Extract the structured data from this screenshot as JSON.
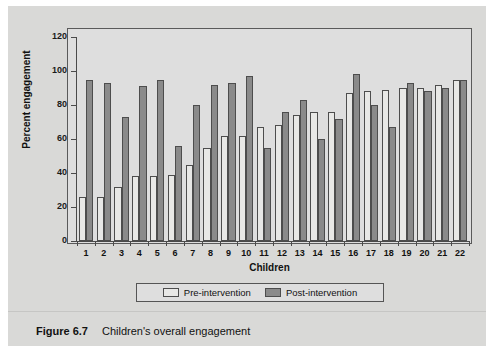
{
  "figure": {
    "caption_number": "Figure 6.7",
    "caption_text": "Children's overall engagement"
  },
  "legend": {
    "position": "bottom",
    "items": [
      {
        "label": "Pre-intervention",
        "color": "#e8e8e6"
      },
      {
        "label": "Post-intervention",
        "color": "#8a8a8a"
      }
    ]
  },
  "axes": {
    "y_title": "Percent engagement",
    "x_title": "Children",
    "y_ticks": [
      "0",
      "20",
      "40",
      "60",
      "80",
      "100",
      "120"
    ]
  },
  "chart_data": {
    "type": "bar",
    "title": "Children's overall engagement",
    "xlabel": "Children",
    "ylabel": "Percent engagement",
    "ylim": [
      0,
      120
    ],
    "ytick_step": 20,
    "grid": false,
    "legend_position": "bottom",
    "categories": [
      "1",
      "2",
      "3",
      "4",
      "5",
      "6",
      "7",
      "8",
      "9",
      "10",
      "11",
      "12",
      "13",
      "14",
      "15",
      "16",
      "17",
      "18",
      "19",
      "20",
      "21",
      "22"
    ],
    "series": [
      {
        "name": "Pre-intervention",
        "color": "#e8e8e6",
        "values": [
          26,
          26,
          32,
          38,
          38,
          39,
          45,
          55,
          62,
          62,
          67,
          68,
          74,
          76,
          76,
          87,
          88,
          89,
          90,
          90,
          92,
          95
        ]
      },
      {
        "name": "Post-intervention",
        "color": "#8a8a8a",
        "values": [
          95,
          93,
          73,
          91,
          95,
          56,
          80,
          92,
          93,
          97,
          55,
          76,
          83,
          60,
          72,
          98,
          80,
          67,
          93,
          88,
          90,
          95
        ]
      }
    ]
  }
}
